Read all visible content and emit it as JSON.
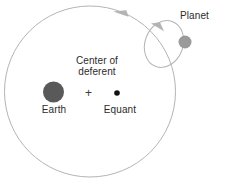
{
  "diagram": {
    "background_color": "#ffffff",
    "line_color": "#b0b0b0",
    "text_color": "#2b2b2b",
    "labels": {
      "center_of_deferent": "Center of\ndeferent",
      "earth": "Earth",
      "equant": "Equant",
      "planet": "Planet"
    },
    "markers": {
      "center_plus": "+"
    },
    "bodies": [
      {
        "name": "earth",
        "label": "Earth",
        "cx": 53.5,
        "cy": 92,
        "r": 10.5,
        "color": "#595959"
      },
      {
        "name": "equant",
        "label": "Equant",
        "cx": 117,
        "cy": 93,
        "r": 2.8,
        "color": "#111111"
      },
      {
        "name": "planet",
        "label": "Planet",
        "cx": 185,
        "cy": 42,
        "r": 6.5,
        "color": "#9a9a9a"
      }
    ],
    "orbits": [
      {
        "name": "deferent",
        "shape": "circle",
        "cx": 90,
        "cy": 91.5,
        "r": 85.5,
        "stroke": "#b4b4b4",
        "stroke_width": 1
      },
      {
        "name": "epicycle",
        "shape": "ellipse",
        "cx": 164,
        "cy": 44,
        "rx": 19,
        "ry": 24,
        "rotation_deg": 20,
        "stroke": "#b4b4b4",
        "stroke_width": 1
      }
    ],
    "arrows": [
      {
        "name": "deferent-direction-arrow",
        "direction": "counterclockwise",
        "x": 123,
        "y": 13
      },
      {
        "name": "epicycle-direction-arrow",
        "direction": "counterclockwise",
        "x": 158,
        "y": 26
      }
    ]
  }
}
